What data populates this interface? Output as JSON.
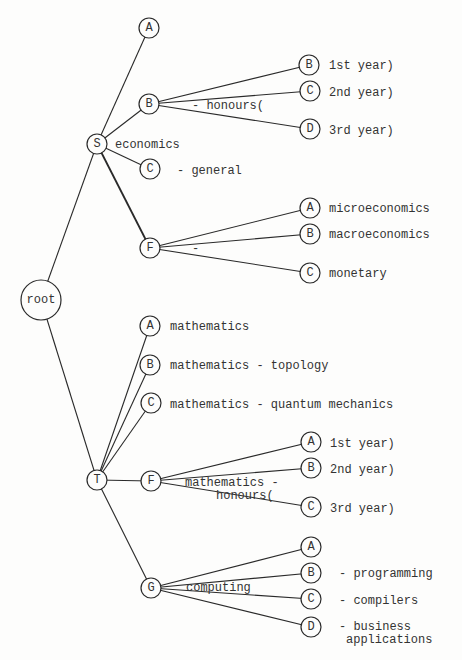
{
  "diagram": {
    "type": "tree",
    "root": {
      "id": "root",
      "label": "root"
    },
    "nodes": [
      {
        "id": "S",
        "label": "S",
        "parent": "root"
      },
      {
        "id": "SA",
        "label": "A",
        "parent": "S"
      },
      {
        "id": "SB",
        "label": "B",
        "parent": "S"
      },
      {
        "id": "SC",
        "label": "C",
        "parent": "S"
      },
      {
        "id": "SF",
        "label": "F",
        "parent": "S"
      },
      {
        "id": "SBB",
        "label": "B",
        "parent": "SB"
      },
      {
        "id": "SBC",
        "label": "C",
        "parent": "SB"
      },
      {
        "id": "SBD",
        "label": "D",
        "parent": "SB"
      },
      {
        "id": "SFA",
        "label": "A",
        "parent": "SF"
      },
      {
        "id": "SFB",
        "label": "B",
        "parent": "SF"
      },
      {
        "id": "SFC",
        "label": "C",
        "parent": "SF"
      },
      {
        "id": "T",
        "label": "T",
        "parent": "root"
      },
      {
        "id": "TA",
        "label": "A",
        "parent": "T"
      },
      {
        "id": "TB",
        "label": "B",
        "parent": "T"
      },
      {
        "id": "TC",
        "label": "C",
        "parent": "T"
      },
      {
        "id": "TF",
        "label": "F",
        "parent": "T"
      },
      {
        "id": "TG",
        "label": "G",
        "parent": "T"
      },
      {
        "id": "TFA",
        "label": "A",
        "parent": "TF"
      },
      {
        "id": "TFB",
        "label": "B",
        "parent": "TF"
      },
      {
        "id": "TFC",
        "label": "C",
        "parent": "TF"
      },
      {
        "id": "TGA",
        "label": "A",
        "parent": "TG"
      },
      {
        "id": "TGB",
        "label": "B",
        "parent": "TG"
      },
      {
        "id": "TGC",
        "label": "C",
        "parent": "TG"
      },
      {
        "id": "TGD",
        "label": "D",
        "parent": "TG"
      }
    ],
    "annotations": {
      "S": "economics",
      "SB": "- honours(",
      "SBB": "1st year)",
      "SBC": "2nd year)",
      "SBD": "3rd year)",
      "SC": "- general",
      "SF": "-",
      "SFA": "microeconomics",
      "SFB": "macroeconomics",
      "SFC": "monetary",
      "TA": "mathematics",
      "TB": "mathematics - topology",
      "TC": "mathematics - quantum mechanics",
      "TF_1": "mathematics -",
      "TF_2": "honours(",
      "TFA": "1st year)",
      "TFB": "2nd year)",
      "TFC": "3rd year)",
      "TG": "computing",
      "TGB": "- programming",
      "TGC": "- compilers",
      "TGD_1": "- business",
      "TGD_2": "applications"
    }
  }
}
